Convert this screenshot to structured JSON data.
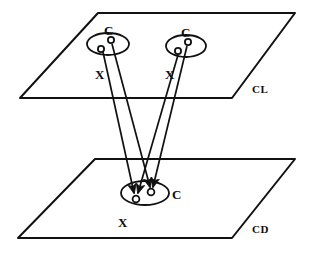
{
  "diagram": {
    "stroke_color": "#111111",
    "fill_color": "#ffffff",
    "background": "#ffffff",
    "planes": [
      {
        "id": "upper-plane",
        "label": "CL",
        "label_x": 252,
        "label_y": 84,
        "points": "98,13 295,13 232,98 20,98"
      },
      {
        "id": "lower-plane",
        "label": "CD",
        "label_x": 252,
        "label_y": 224,
        "points": "95,159 295,159 232,238 18,238"
      }
    ],
    "ellipses": [
      {
        "id": "upper-left-group",
        "cx": 108,
        "cy": 44,
        "rx": 21,
        "ry": 11,
        "rotation": 0
      },
      {
        "id": "upper-right-group",
        "cx": 186,
        "cy": 46,
        "rx": 20,
        "ry": 11,
        "rotation": 0
      },
      {
        "id": "lower-group",
        "cx": 145,
        "cy": 193,
        "rx": 24,
        "ry": 12,
        "rotation": 0
      }
    ],
    "nodes": [
      {
        "id": "upper-left-c",
        "label": "C",
        "cx": 111,
        "cy": 40,
        "r": 3.1,
        "label_x": 104,
        "label_y": 24
      },
      {
        "id": "upper-left-x",
        "label": "X",
        "cx": 101,
        "cy": 49,
        "r": 3.1,
        "label_x": 95,
        "label_y": 68
      },
      {
        "id": "upper-right-c",
        "label": "C",
        "cx": 188,
        "cy": 42,
        "r": 3.1,
        "label_x": 181,
        "label_y": 26
      },
      {
        "id": "upper-right-x",
        "label": "X",
        "cx": 178,
        "cy": 51,
        "r": 3.1,
        "label_x": 165,
        "label_y": 68
      },
      {
        "id": "lower-c",
        "label": "C",
        "cx": 151,
        "cy": 192,
        "r": 3.4,
        "label_x": 172,
        "label_y": 188
      },
      {
        "id": "lower-x",
        "label": "X",
        "cx": 136,
        "cy": 199,
        "r": 3.4,
        "label_x": 118,
        "label_y": 216
      }
    ],
    "connectors": [
      {
        "id": "left-c-to-lower-c",
        "from": "upper-left-c",
        "to": "lower-c",
        "x1": 112,
        "y1": 44,
        "x2": 150,
        "y2": 187,
        "arrow": true
      },
      {
        "id": "left-x-to-lower-x",
        "from": "upper-left-x",
        "to": "lower-x",
        "x1": 103,
        "y1": 52,
        "x2": 134,
        "y2": 193,
        "arrow": true
      },
      {
        "id": "right-c-to-lower-c",
        "from": "upper-right-c",
        "to": "lower-c",
        "x1": 187,
        "y1": 46,
        "x2": 153,
        "y2": 187,
        "arrow": true
      },
      {
        "id": "right-x-to-lower-x",
        "from": "upper-right-x",
        "to": "lower-x",
        "x1": 178,
        "y1": 55,
        "x2": 138,
        "y2": 193,
        "arrow": true
      }
    ]
  }
}
